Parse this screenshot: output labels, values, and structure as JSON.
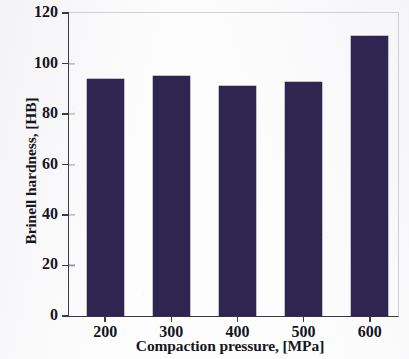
{
  "chart_data": {
    "type": "bar",
    "title": "",
    "subtitle": "",
    "xlabel": "Compaction pressure, [MPa]",
    "ylabel": "Brinell hardness, [HB]",
    "categories": [
      "200",
      "300",
      "400",
      "500",
      "600"
    ],
    "values": [
      94,
      95,
      91,
      92.5,
      111
    ],
    "series": [
      {
        "name": "Brinell hardness",
        "values": [
          94,
          95,
          91,
          92.5,
          111
        ]
      }
    ],
    "ylim": [
      0,
      120
    ],
    "yticks": [
      0,
      20,
      40,
      60,
      80,
      100,
      120
    ],
    "ytick_labels": [
      "0",
      "20",
      "40",
      "60",
      "80",
      "100",
      "120"
    ],
    "xtick_labels": [
      "200",
      "300",
      "400",
      "500",
      "600"
    ],
    "grid": false,
    "legend": null,
    "legend_position": "none",
    "bar_color": "#2E2550",
    "axis_color": "#3A3A46",
    "text_color": "#15151E",
    "background": "#FDFDFD"
  }
}
